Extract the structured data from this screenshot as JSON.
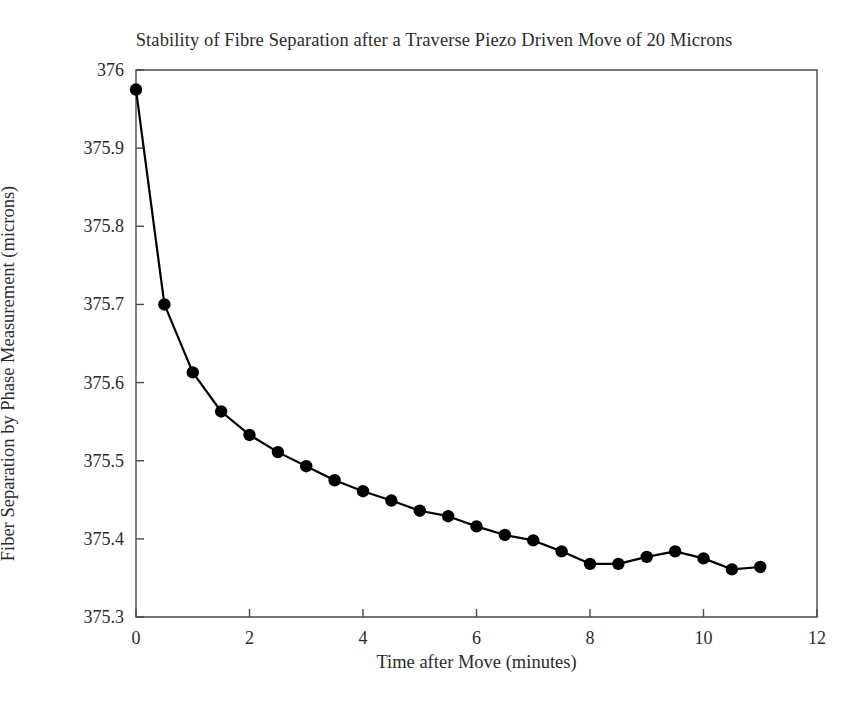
{
  "chart_data": {
    "type": "line",
    "title": "Stability of Fibre Separation after a Traverse Piezo Driven Move of 20 Microns",
    "xlabel": "Time after Move (minutes)",
    "ylabel": "Fiber Separation by Phase Measurement (microns)",
    "xlim": [
      0,
      12
    ],
    "ylim": [
      375.3,
      376
    ],
    "xticks": [
      "0",
      "2",
      "4",
      "6",
      "8",
      "10",
      "12"
    ],
    "xtick_values": [
      0,
      2,
      4,
      6,
      8,
      10,
      12
    ],
    "yticks": [
      "375.3",
      "375.4",
      "375.5",
      "375.6",
      "375.7",
      "375.8",
      "375.9",
      "376"
    ],
    "ytick_values": [
      375.3,
      375.4,
      375.5,
      375.6,
      375.7,
      375.8,
      375.9,
      376
    ],
    "grid": false,
    "legend": null,
    "marker": "circle",
    "marker_color": "#000000",
    "line_color": "#000000",
    "x": [
      0,
      0.5,
      1,
      1.5,
      2,
      2.5,
      3,
      3.5,
      4,
      4.5,
      5,
      5.5,
      6,
      6.5,
      7,
      7.5,
      8,
      8.5,
      9,
      9.5,
      10,
      10.5,
      11
    ],
    "values": [
      375.975,
      375.7,
      375.613,
      375.563,
      375.533,
      375.511,
      375.493,
      375.475,
      375.461,
      375.449,
      375.436,
      375.429,
      375.416,
      375.405,
      375.398,
      375.384,
      375.368,
      375.368,
      375.377,
      375.384,
      375.375,
      375.361,
      375.364
    ]
  }
}
